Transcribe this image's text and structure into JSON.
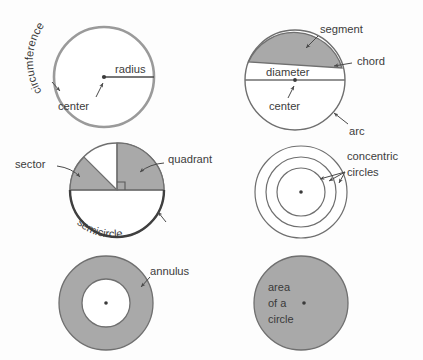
{
  "diagram": {
    "colors": {
      "shade_fill": "#a9a9a9",
      "stroke": "#7c7c7c",
      "stroke_dark": "#5a5a5a",
      "text": "#3c3c3c",
      "background": "#fdfdfd",
      "white_fill": "#ffffff"
    },
    "panels": [
      {
        "id": "panel-circumference",
        "name": "circumference-panel",
        "labels": [
          {
            "key": "circumference",
            "text": "circumference"
          },
          {
            "key": "radius",
            "text": "radius"
          },
          {
            "key": "center",
            "text": "center"
          }
        ]
      },
      {
        "id": "panel-segment",
        "name": "segment-panel",
        "labels": [
          {
            "key": "segment",
            "text": "segment"
          },
          {
            "key": "chord",
            "text": "chord"
          },
          {
            "key": "diameter",
            "text": "diameter"
          },
          {
            "key": "center",
            "text": "center"
          },
          {
            "key": "arc",
            "text": "arc"
          }
        ]
      },
      {
        "id": "panel-sector",
        "name": "sector-panel",
        "labels": [
          {
            "key": "sector",
            "text": "sector"
          },
          {
            "key": "quadrant",
            "text": "quadrant"
          },
          {
            "key": "semicircle",
            "text": "semicircle"
          }
        ]
      },
      {
        "id": "panel-concentric",
        "name": "concentric-panel",
        "labels": [
          {
            "key": "concentric",
            "text": "concentric"
          },
          {
            "key": "circles",
            "text": "circles"
          }
        ]
      },
      {
        "id": "panel-annulus",
        "name": "annulus-panel",
        "labels": [
          {
            "key": "annulus",
            "text": "annulus"
          }
        ]
      },
      {
        "id": "panel-area",
        "name": "area-panel",
        "labels": [
          {
            "key": "area",
            "text": "area"
          },
          {
            "key": "ofa",
            "text": "of a"
          },
          {
            "key": "circle",
            "text": "circle"
          }
        ]
      }
    ],
    "text": {
      "circumference": "circumference",
      "radius": "radius",
      "center1": "center",
      "segment": "segment",
      "chord": "chord",
      "diameter": "diameter",
      "center2": "center",
      "arc": "arc",
      "sector": "sector",
      "quadrant": "quadrant",
      "semicircle": "semicircle",
      "concentric": "concentric",
      "circles": "circles",
      "annulus": "annulus",
      "area": "area",
      "ofa": "of a",
      "circle": "circle"
    }
  }
}
